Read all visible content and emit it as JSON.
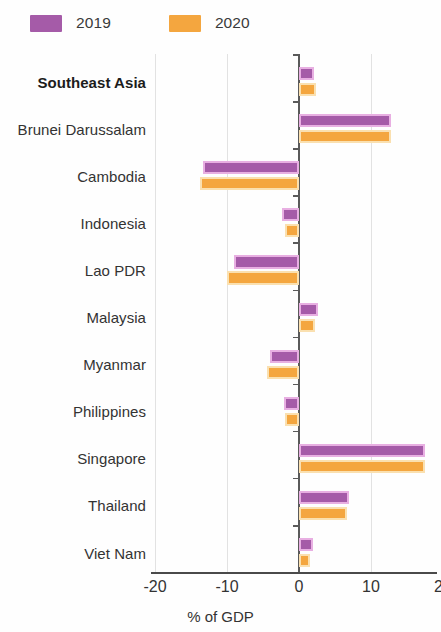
{
  "legend": {
    "position": "top-left",
    "entries": [
      {
        "label": "2019",
        "color": "#A55BA8"
      },
      {
        "label": "2020",
        "color": "#F4A63F"
      }
    ]
  },
  "axis": {
    "x_title": "% of GDP",
    "x_ticks": [
      "-20",
      "-10",
      "0",
      "10",
      "20"
    ],
    "x_tick_values": [
      -20,
      -10,
      0,
      10,
      20
    ]
  },
  "colors": {
    "series_2019_fill": "#A55BA8",
    "series_2019_edge": "#E8AFE2",
    "series_2020_fill": "#F4A63F",
    "series_2020_edge": "#FAE0B0",
    "gridline": "#E2E2E2",
    "axis": "#5A5A5A",
    "text": "#333333"
  },
  "chart_data": {
    "type": "bar",
    "orientation": "horizontal",
    "title": "",
    "subtitle": "",
    "xlabel": "% of GDP",
    "ylabel": "",
    "xlim": [
      -20,
      20
    ],
    "xticks": [
      -20,
      -10,
      0,
      10,
      20
    ],
    "grid": true,
    "grid_axis": "x",
    "legend_position": "top-left",
    "categories": [
      "Southeast Asia",
      "Brunei Darussalam",
      "Cambodia",
      "Indonesia",
      "Lao PDR",
      "Malaysia",
      "Myanmar",
      "Philippines",
      "Singapore",
      "Thailand",
      "Viet Nam"
    ],
    "highlighted_categories": [
      "Southeast Asia"
    ],
    "series": [
      {
        "name": "2019",
        "color": "#A55BA8",
        "values": [
          2.1,
          12.8,
          -13.3,
          -2.4,
          -9.0,
          2.6,
          -4.0,
          -2.1,
          17.5,
          7.0,
          2.0
        ]
      },
      {
        "name": "2020",
        "color": "#F4A63F",
        "values": [
          2.4,
          12.8,
          -13.8,
          -2.0,
          -10.0,
          2.2,
          -4.5,
          -2.0,
          17.5,
          6.6,
          1.5
        ]
      }
    ]
  }
}
